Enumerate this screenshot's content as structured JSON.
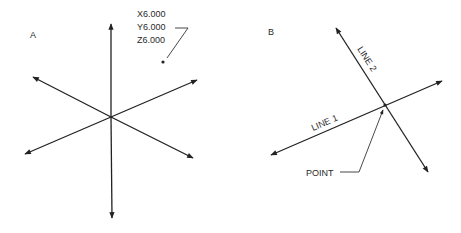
{
  "panels": [
    {
      "id": "A",
      "label": "A",
      "coordinate_label": {
        "x": "X6.000",
        "y": "Y6.000",
        "z": "Z6.000"
      },
      "description": "Three intersecting axes with a labeled point"
    },
    {
      "id": "B",
      "label": "B",
      "lines": [
        "LINE 1",
        "LINE 2"
      ],
      "point_label": "POINT",
      "description": "Two intersecting lines defining a point"
    }
  ],
  "colors": {
    "line": "#222222",
    "text": "#2a2a2a",
    "background": "#ffffff"
  }
}
